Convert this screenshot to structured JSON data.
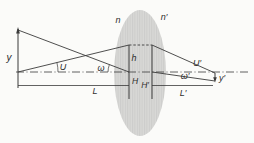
{
  "figure": {
    "type": "optical-system-imaging-diagram",
    "labels": {
      "n": "n",
      "n_prime": "n′",
      "y": "y",
      "y_prime": "y′",
      "U": "U",
      "U_prime": "U′",
      "omega": "ω",
      "omega_prime": "ω′",
      "h": "h",
      "H": "H",
      "H_prime": "H′",
      "L": "L",
      "L_prime": "L′"
    },
    "colors": {
      "line": "#3b3b3b",
      "text": "#2e2e2e",
      "lens_fill": "#d8d8d6",
      "lens_hatch": "#cccccb",
      "background": "#fbfbf9"
    }
  }
}
